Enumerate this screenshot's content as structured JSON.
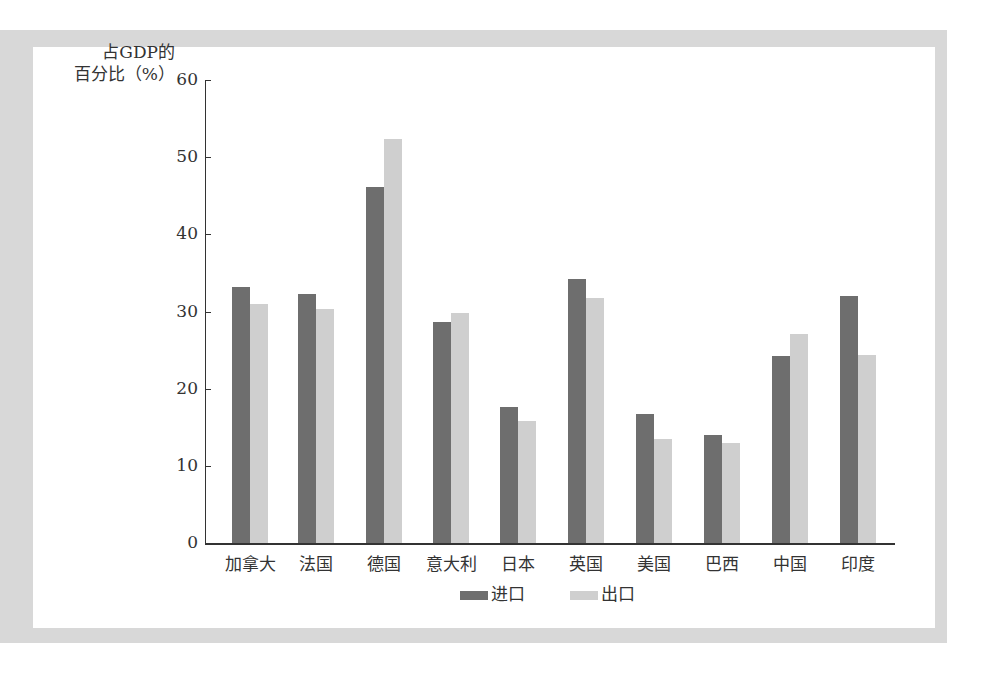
{
  "chart_data": {
    "type": "bar",
    "title": "",
    "xlabel": "",
    "ylabel": "占GDP的百分比（%）",
    "ylabel_lines": [
      "占GDP的",
      "百分比（%）"
    ],
    "ylim": [
      0,
      60
    ],
    "yticks": [
      0,
      10,
      20,
      30,
      40,
      50,
      60
    ],
    "grid": false,
    "legend_position": "bottom",
    "categories": [
      "加拿大",
      "法国",
      "德国",
      "意大利",
      "日本",
      "英国",
      "美国",
      "巴西",
      "中国",
      "印度"
    ],
    "series": [
      {
        "name": "进口",
        "color": "#6e6e6e",
        "values": [
          33.2,
          32.3,
          46.1,
          28.6,
          17.6,
          34.2,
          16.7,
          14.0,
          24.2,
          32.0
        ]
      },
      {
        "name": "出口",
        "color": "#cfcfcf",
        "values": [
          31.0,
          30.3,
          52.3,
          29.8,
          15.8,
          31.7,
          13.5,
          13.0,
          27.1,
          24.4
        ]
      }
    ]
  },
  "legend": {
    "import_label": "进口",
    "export_label": "出口"
  }
}
